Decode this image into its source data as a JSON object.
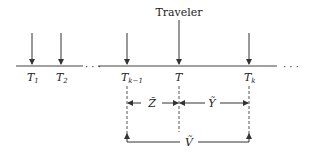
{
  "diagram": {
    "traveler_label": "Traveler",
    "ellipsis": "· · ·",
    "arrivals": [
      {
        "label": "T",
        "sub": "1"
      },
      {
        "label": "T",
        "sub": "2"
      },
      {
        "label": "T",
        "sub": "k−1"
      },
      {
        "label": "T",
        "sub": ""
      },
      {
        "label": "T",
        "sub": "k"
      }
    ],
    "intervals": {
      "z": "Z̃",
      "y": "Ỹ",
      "v": "Ṽ"
    },
    "colors": {
      "stroke": "#333333"
    }
  }
}
